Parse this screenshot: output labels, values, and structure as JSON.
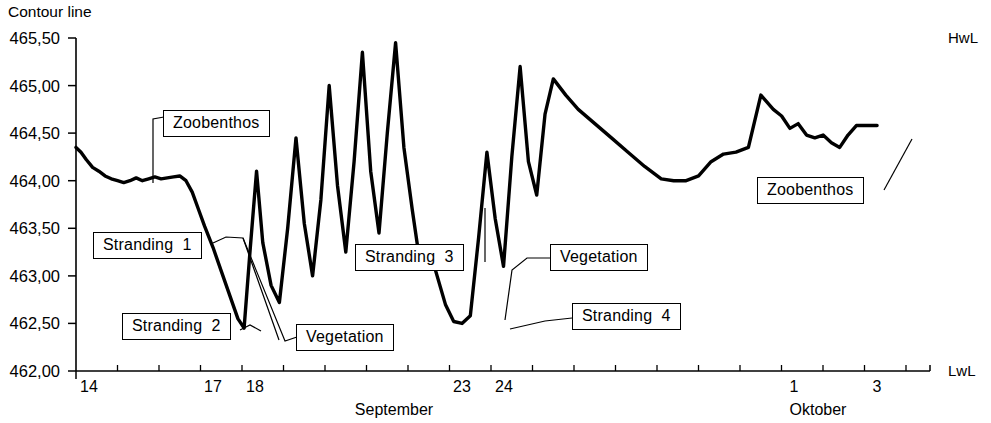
{
  "chart_data": {
    "type": "line",
    "title": "",
    "ylabel": "Contour line",
    "xlabel": "",
    "axis_corner_top_right": "HwL",
    "axis_corner_bottom_right": "LwL",
    "ylim": [
      462.0,
      465.5
    ],
    "ytick_labels": [
      "465,50",
      "465,00",
      "464,50",
      "464,00",
      "463,50",
      "463,00",
      "462,50",
      "462,00"
    ],
    "ytick_values": [
      465.5,
      465.0,
      464.5,
      464.0,
      463.5,
      463.0,
      462.5,
      462.0
    ],
    "xtick_labels": [
      "14",
      "17",
      "18",
      "23",
      "24",
      "1",
      "3"
    ],
    "xtick_values": [
      14,
      17,
      18,
      23,
      24,
      31,
      33
    ],
    "month_labels": [
      "September",
      "Oktober"
    ],
    "grid": false,
    "legend": "none",
    "series": [
      {
        "name": "Contour line",
        "x": [
          14.0,
          14.12,
          14.25,
          14.4,
          14.55,
          14.7,
          14.85,
          15.0,
          15.15,
          15.3,
          15.45,
          15.6,
          15.75,
          15.9,
          16.05,
          16.2,
          16.35,
          16.5,
          16.65,
          16.8,
          16.95,
          17.1,
          17.3,
          17.5,
          17.7,
          17.9,
          18.05,
          18.2,
          18.35,
          18.5,
          18.7,
          18.9,
          19.1,
          19.3,
          19.5,
          19.7,
          19.9,
          20.1,
          20.3,
          20.5,
          20.7,
          20.9,
          21.1,
          21.3,
          21.5,
          21.7,
          21.9,
          22.1,
          22.3,
          22.5,
          22.7,
          22.9,
          23.1,
          23.3,
          23.5,
          23.7,
          23.9,
          24.1,
          24.3,
          24.5,
          24.7,
          24.9,
          25.1,
          25.3,
          25.5,
          25.8,
          26.1,
          26.5,
          26.9,
          27.3,
          27.7,
          28.1,
          28.4,
          28.7,
          29.0,
          29.3,
          29.6,
          29.9,
          30.2,
          30.5,
          30.8,
          31.0,
          31.2,
          31.4,
          31.6,
          31.8,
          32.0,
          32.2,
          32.4,
          32.6,
          32.8,
          33.0,
          33.3
        ],
        "y": [
          464.35,
          464.3,
          464.22,
          464.14,
          464.1,
          464.05,
          464.02,
          464.0,
          463.98,
          464.0,
          464.03,
          464.0,
          464.02,
          464.04,
          464.02,
          464.03,
          464.04,
          464.05,
          464.0,
          463.88,
          463.7,
          463.52,
          463.3,
          463.05,
          462.8,
          462.55,
          462.45,
          463.3,
          464.1,
          463.35,
          462.9,
          462.72,
          463.5,
          464.45,
          463.55,
          463.0,
          463.8,
          465.0,
          463.95,
          463.25,
          464.2,
          465.35,
          464.1,
          463.45,
          464.5,
          465.45,
          464.35,
          463.7,
          463.1,
          463.3,
          463.0,
          462.7,
          462.52,
          462.5,
          462.58,
          463.4,
          464.3,
          463.6,
          463.1,
          464.25,
          465.2,
          464.2,
          463.85,
          464.7,
          465.07,
          464.9,
          464.75,
          464.6,
          464.45,
          464.3,
          464.15,
          464.02,
          464.0,
          464.0,
          464.05,
          464.2,
          464.28,
          464.3,
          464.35,
          464.9,
          464.75,
          464.68,
          464.55,
          464.6,
          464.48,
          464.45,
          464.48,
          464.4,
          464.35,
          464.48,
          464.58,
          464.58,
          464.58
        ]
      }
    ],
    "annotations": [
      {
        "id": "zoobenthos-left",
        "label": "Zoobenthos"
      },
      {
        "id": "stranding-1",
        "label": "Stranding  1"
      },
      {
        "id": "stranding-2",
        "label": "Stranding  2"
      },
      {
        "id": "vegetation-left",
        "label": "Vegetation"
      },
      {
        "id": "stranding-3",
        "label": "Stranding  3"
      },
      {
        "id": "vegetation-right",
        "label": "Vegetation"
      },
      {
        "id": "stranding-4",
        "label": "Stranding  4"
      },
      {
        "id": "zoobenthos-right",
        "label": "Zoobenthos"
      }
    ]
  },
  "colors": {
    "line": "#000000",
    "axis": "#000000",
    "background": "#ffffff"
  }
}
